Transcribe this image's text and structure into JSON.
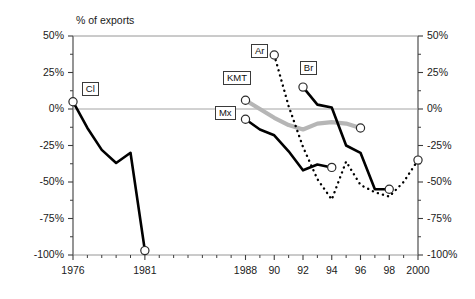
{
  "chart_data": {
    "type": "line",
    "title": "% of exports",
    "xlabel": "",
    "ylabel": "% of exports",
    "ylim": [
      -100,
      50
    ],
    "xlim": [
      1976,
      2000
    ],
    "grid": false,
    "legend_position": "inline-labels",
    "y_ticks": [
      "50%",
      "25%",
      "0%",
      "-25%",
      "-50%",
      "-75%",
      "-100%"
    ],
    "y_tick_values": [
      50,
      25,
      0,
      -25,
      -50,
      -75,
      -100
    ],
    "y_minor_tick_values": [
      37.5,
      12.5,
      -12.5,
      -37.5,
      -62.5,
      -87.5
    ],
    "x_ticks": [
      "1976",
      "1981",
      "1988",
      "90",
      "92",
      "94",
      "96",
      "98",
      "2000"
    ],
    "x_tick_values": [
      1976,
      1981,
      1988,
      1990,
      1992,
      1994,
      1996,
      1998,
      2000
    ],
    "x_minor_tick_values": [
      1977,
      1978,
      1979,
      1980,
      1982,
      1983,
      1984,
      1985,
      1986,
      1987,
      1989,
      1991,
      1993,
      1995,
      1997,
      1999
    ],
    "zero_line": 0,
    "series": [
      {
        "name": "Cl",
        "label": "Cl",
        "style": "solid",
        "color": "#000000",
        "width": 2.6,
        "marker_start": true,
        "marker_end": true,
        "x": [
          1976,
          1977,
          1978,
          1979,
          1980,
          1981
        ],
        "values": [
          5,
          -13,
          -28,
          -37,
          -30,
          -97
        ]
      },
      {
        "name": "KMT",
        "label": "KMT",
        "style": "solid",
        "color": "#b6b6b6",
        "width": 4.2,
        "marker_start": true,
        "marker_end": true,
        "x": [
          1988,
          1989,
          1990,
          1991,
          1992,
          1993,
          1994,
          1995,
          1996
        ],
        "values": [
          6,
          0,
          -6,
          -11,
          -14,
          -10,
          -9,
          -10,
          -13
        ]
      },
      {
        "name": "Mx",
        "label": "Mx",
        "style": "solid",
        "color": "#000000",
        "width": 2.6,
        "marker_start": true,
        "marker_end": true,
        "x": [
          1988,
          1989,
          1990,
          1991,
          1992,
          1993,
          1994
        ],
        "values": [
          -7,
          -14,
          -18,
          -29,
          -42,
          -38,
          -40
        ]
      },
      {
        "name": "Ar",
        "label": "Ar",
        "style": "dotted",
        "color": "#000000",
        "width": 2.4,
        "marker_start": true,
        "marker_end": true,
        "x": [
          1990,
          1991,
          1992,
          1993,
          1994,
          1995,
          1996,
          1997,
          1998,
          1999,
          2000
        ],
        "values": [
          37,
          2,
          -26,
          -48,
          -62,
          -36,
          -52,
          -57,
          -60,
          -50,
          -35
        ]
      },
      {
        "name": "Br",
        "label": "Br",
        "style": "solid",
        "color": "#000000",
        "width": 2.6,
        "marker_start": true,
        "marker_end": true,
        "x": [
          1992,
          1993,
          1994,
          1995,
          1996,
          1997,
          1998
        ],
        "values": [
          15,
          3,
          1,
          -25,
          -30,
          -55,
          -55
        ]
      }
    ],
    "series_label_positions": [
      {
        "name": "Cl",
        "x": 1977.2,
        "y": 14
      },
      {
        "name": "KMT",
        "x": 1987.4,
        "y": 21
      },
      {
        "name": "Mx",
        "x": 1986.6,
        "y": -3
      },
      {
        "name": "Ar",
        "x": 1989.0,
        "y": 40
      },
      {
        "name": "Br",
        "x": 1992.4,
        "y": 28
      }
    ]
  }
}
